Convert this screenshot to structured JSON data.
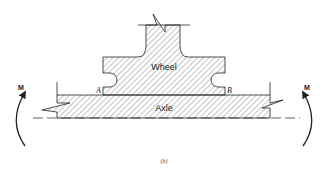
{
  "diagram": {
    "caption": "(b)",
    "labels": {
      "wheel": "Wheel",
      "axle": "Axle",
      "point_a": "A",
      "point_b": "B",
      "moment_left": "M",
      "moment_right": "M"
    },
    "colors": {
      "stroke": "#222222",
      "hatch": "#555555",
      "background": "#ffffff"
    }
  }
}
